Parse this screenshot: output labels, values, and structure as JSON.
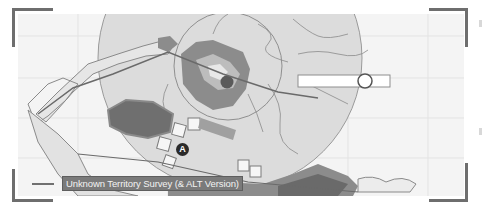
{
  "map": {
    "legend_label": "Unknown Territory Survey (& ALT Version)",
    "marker_label": "A",
    "icons": {
      "marker": "waypoint-marker-icon",
      "slider_handle": "circle-handle-icon",
      "legend_line": "route-line-icon"
    },
    "colors": {
      "background": "#f4f4f4",
      "grid": "#e2e2e2",
      "zone_fill": "#d8d8d8",
      "terrain_dark": "#6f6f6f",
      "terrain_mid": "#8c8c8c",
      "terrain_light": "#b5b5b5",
      "frame": "#6e6e6e",
      "legend_bg": "#7a7a7a",
      "legend_text": "#f2f2f2"
    }
  }
}
